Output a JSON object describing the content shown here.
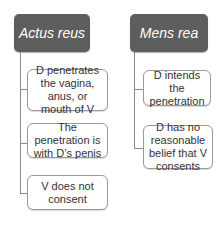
{
  "diagram": {
    "columns": [
      {
        "title": "Actus reus",
        "items": [
          "D penetrates the vagina, anus, or mouth of V",
          "The penetration is with D’s penis",
          "V does not consent"
        ]
      },
      {
        "title": "Mens rea",
        "items": [
          "D intends the penetration",
          "D has no reasonable belief that V consents"
        ]
      }
    ],
    "colors": {
      "header_bg": "#5e5e5e",
      "header_text": "#ffffff",
      "box_border": "#9a9a9a",
      "connector": "#8a8a8a"
    }
  }
}
